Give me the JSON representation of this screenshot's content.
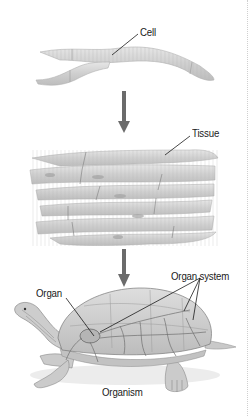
{
  "diagram": {
    "levels": [
      {
        "id": "cell",
        "label": "Cell"
      },
      {
        "id": "tissue",
        "label": "Tissue"
      },
      {
        "id": "organ",
        "label": "Organ"
      },
      {
        "id": "organ_system",
        "label": "Organ system"
      },
      {
        "id": "organism",
        "label": "Organism"
      }
    ],
    "flow": [
      "Cell",
      "Tissue",
      "Organism"
    ],
    "colors": {
      "arrow": "#6b6b6b",
      "fiber": "#d2d2d2",
      "fiber_edge": "#a8a8a8",
      "shell": "#cfcfcf",
      "vessel": "#7a7a7a",
      "text": "#1a1a1a"
    }
  }
}
